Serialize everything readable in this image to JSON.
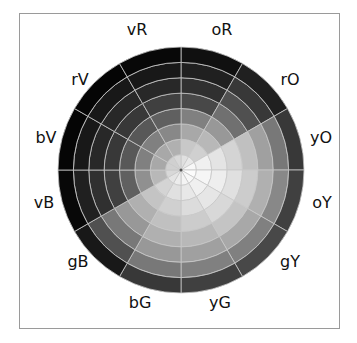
{
  "diagram": {
    "title": "",
    "type": "value wheel",
    "center": [
      181,
      170
    ],
    "outer_radius": 123,
    "ring_count": 8,
    "sector_count": 12,
    "divider_color": "#c8c8c8",
    "frame_color": "#9a9a9a",
    "sectors": [
      {
        "label": "oR",
        "start_deg": 0,
        "label_pos": [
          222,
          30
        ],
        "ring_grays": [
          "#e0e0e0",
          "#c8c8c8",
          "#a8a8a8",
          "#808080",
          "#484848",
          "#303030",
          "#202020",
          "#101010"
        ]
      },
      {
        "label": "rO",
        "start_deg": 30,
        "label_pos": [
          290,
          80
        ],
        "ring_grays": [
          "#e8e8e8",
          "#d0d0d0",
          "#b8b8b8",
          "#989898",
          "#707070",
          "#505050",
          "#383838",
          "#202020"
        ]
      },
      {
        "label": "yO",
        "start_deg": 60,
        "label_pos": [
          321,
          138
        ],
        "ring_grays": [
          "#f8f8f8",
          "#f0f0f0",
          "#e4e4e4",
          "#d4d4d4",
          "#c0c0c0",
          "#a0a0a0",
          "#787878",
          "#383838"
        ]
      },
      {
        "label": "oY",
        "start_deg": 90,
        "label_pos": [
          322,
          203
        ],
        "ring_grays": [
          "#fcfcfc",
          "#f6f6f6",
          "#eeeeee",
          "#e0e0e0",
          "#cccccc",
          "#b0b0b0",
          "#888888",
          "#404040"
        ]
      },
      {
        "label": "gY",
        "start_deg": 120,
        "label_pos": [
          290,
          262
        ],
        "ring_grays": [
          "#f8f8f8",
          "#f0f0f0",
          "#e6e6e6",
          "#d8d8d8",
          "#c4c4c4",
          "#a8a8a8",
          "#808080",
          "#484848"
        ]
      },
      {
        "label": "yG",
        "start_deg": 150,
        "label_pos": [
          220,
          303
        ],
        "ring_grays": [
          "#f4f4f4",
          "#e8e8e8",
          "#dcdcdc",
          "#cccccc",
          "#b8b8b8",
          "#a0a0a0",
          "#808080",
          "#404040"
        ]
      },
      {
        "label": "bG",
        "start_deg": 180,
        "label_pos": [
          140,
          303
        ],
        "ring_grays": [
          "#ececec",
          "#e0e0e0",
          "#d0d0d0",
          "#c0c0c0",
          "#b0b0b0",
          "#989898",
          "#787878",
          "#383838"
        ]
      },
      {
        "label": "gB",
        "start_deg": 210,
        "label_pos": [
          78,
          262
        ],
        "ring_grays": [
          "#e4e4e4",
          "#d4d4d4",
          "#c4c4c4",
          "#b0b0b0",
          "#989898",
          "#787878",
          "#505050",
          "#181818"
        ]
      },
      {
        "label": "vB",
        "start_deg": 240,
        "label_pos": [
          44,
          203
        ],
        "ring_grays": [
          "#d8d8d8",
          "#b8b8b8",
          "#909090",
          "#606060",
          "#404040",
          "#303030",
          "#202020",
          "#080808"
        ]
      },
      {
        "label": "bV",
        "start_deg": 270,
        "label_pos": [
          46,
          138
        ],
        "ring_grays": [
          "#d0d0d0",
          "#a8a8a8",
          "#808080",
          "#585858",
          "#383838",
          "#282828",
          "#181818",
          "#050505"
        ]
      },
      {
        "label": "rV",
        "start_deg": 300,
        "label_pos": [
          80,
          80
        ],
        "ring_grays": [
          "#d0d0d0",
          "#a8a8a8",
          "#808080",
          "#585858",
          "#383838",
          "#282828",
          "#181818",
          "#050505"
        ]
      },
      {
        "label": "vR",
        "start_deg": 330,
        "label_pos": [
          137,
          30
        ],
        "ring_grays": [
          "#d8d8d8",
          "#b0b0b0",
          "#888888",
          "#606060",
          "#404040",
          "#282828",
          "#181818",
          "#080808"
        ]
      }
    ]
  }
}
